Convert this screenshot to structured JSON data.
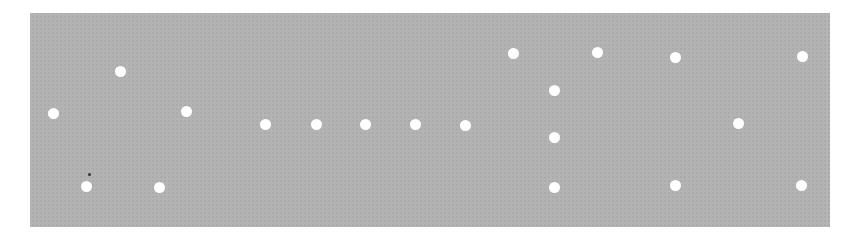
{
  "panel": {
    "background": "#b3b3b3",
    "dot_color": "#ffffff"
  },
  "dots": [
    {
      "x": 53,
      "y": 113
    },
    {
      "x": 120,
      "y": 71
    },
    {
      "x": 86,
      "y": 186
    },
    {
      "x": 186,
      "y": 111
    },
    {
      "x": 159,
      "y": 187
    },
    {
      "x": 265,
      "y": 124
    },
    {
      "x": 316,
      "y": 124
    },
    {
      "x": 365,
      "y": 124
    },
    {
      "x": 415,
      "y": 124
    },
    {
      "x": 465,
      "y": 125
    },
    {
      "x": 513,
      "y": 53
    },
    {
      "x": 554,
      "y": 90
    },
    {
      "x": 554,
      "y": 137
    },
    {
      "x": 554,
      "y": 187
    },
    {
      "x": 597,
      "y": 52
    },
    {
      "x": 675,
      "y": 57
    },
    {
      "x": 738,
      "y": 123
    },
    {
      "x": 675,
      "y": 185
    },
    {
      "x": 802,
      "y": 56
    },
    {
      "x": 801,
      "y": 185
    }
  ]
}
